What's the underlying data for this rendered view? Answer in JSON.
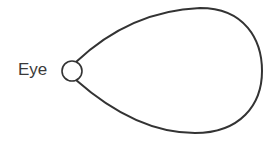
{
  "diagram": {
    "label": "Eye",
    "shape": "teardrop-visual-field",
    "colors": {
      "stroke": "#333333",
      "text": "#3a3a3a",
      "background": "#ffffff"
    }
  }
}
